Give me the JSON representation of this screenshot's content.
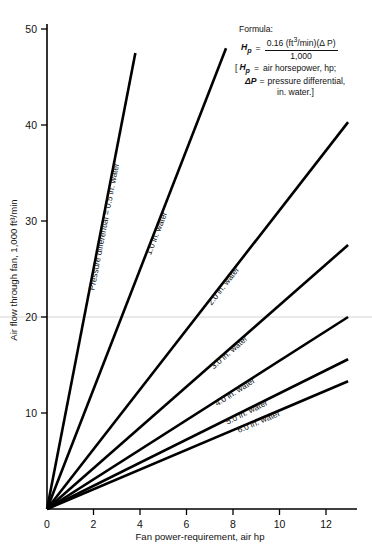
{
  "chart_data": {
    "type": "line",
    "title": "",
    "xlabel": "Fan power-requirement, air hp",
    "ylabel": "Air flow through fan, 1,000 ft³/min",
    "xlim": [
      0,
      13
    ],
    "ylim": [
      0,
      52
    ],
    "xticks": [
      0,
      2,
      4,
      6,
      8,
      10,
      12
    ],
    "yticks": [
      10,
      20,
      30,
      40,
      50
    ],
    "xtick_labels": [
      "0",
      "2",
      "4",
      "6",
      "8",
      "10",
      "12"
    ],
    "ytick_labels": [
      "10",
      "20",
      "30",
      "40",
      "50"
    ],
    "grid": false,
    "legend_position": "inline-curve-labels",
    "note": "All lines pass through the origin; slope = 6.25/ΔP thousand ft³/min per hp",
    "series": [
      {
        "name": "Pressure differential = 0.5 in. water",
        "label": "Pressure differential = 0.5 in. water",
        "delta_p": 0.5,
        "slope": 12.5,
        "x": [
          0,
          3.8
        ],
        "y": [
          0,
          47.5
        ]
      },
      {
        "name": "1.0 in. water",
        "label": "1.0 in. water",
        "delta_p": 1.0,
        "slope": 6.25,
        "x": [
          0,
          7.7
        ],
        "y": [
          0,
          48.0
        ]
      },
      {
        "name": "2.0 in. water",
        "label": "2.0 in. water",
        "delta_p": 2.0,
        "slope": 3.125,
        "x": [
          0,
          12.95
        ],
        "y": [
          0,
          40.3
        ]
      },
      {
        "name": "3.0 in. water",
        "label": "3.0 in. water",
        "delta_p": 3.0,
        "slope": 2.083,
        "x": [
          0,
          12.95
        ],
        "y": [
          0,
          27.5
        ]
      },
      {
        "name": "4.0 in. water",
        "label": "4.0 in. water",
        "delta_p": 4.0,
        "slope": 1.5625,
        "x": [
          0,
          12.95
        ],
        "y": [
          0,
          20.0
        ]
      },
      {
        "name": "5.0 in. water",
        "label": "5.0 in. water",
        "delta_p": 5.0,
        "slope": 1.25,
        "x": [
          0,
          12.95
        ],
        "y": [
          0,
          15.6
        ]
      },
      {
        "name": "6.0 in. water",
        "label": "6.0 in. water",
        "delta_p": 6.0,
        "slope": 1.042,
        "x": [
          0,
          12.95
        ],
        "y": [
          0,
          13.3
        ]
      }
    ]
  },
  "formula": {
    "heading": "Formula:",
    "lhs": "H",
    "lhs_sub": "p",
    "equals": "=",
    "numerator_a": "0.16  (ft",
    "numerator_sup": "3",
    "numerator_b": "/min)(Δ P)",
    "denominator": "1,000",
    "bracket_open": "[",
    "def1_sym": "H",
    "def1_sub": "p",
    "def1_eq": "=",
    "def1_text": "air horsepower, hp;",
    "def2_sym": "ΔP",
    "def2_eq": "=",
    "def2_text": "pressure differential,",
    "def3_text": "in. water.]"
  },
  "axes": {
    "x_title": "Fan power-requirement, air hp",
    "y_title": "Air flow through fan, 1,000 ft³/min"
  }
}
